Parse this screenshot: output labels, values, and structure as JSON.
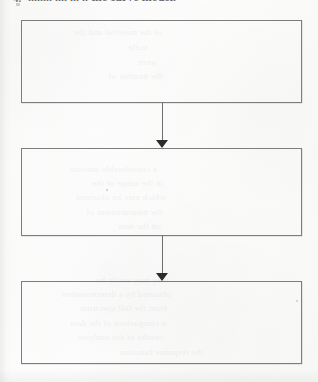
{
  "document": {
    "kind": "scanned-page-flowchart",
    "page_background_color": "#fdfdfd",
    "ink_color": "#2b2b2b",
    "box_border_color": "#7d7d7d",
    "connector_color": "#6e6e6e"
  },
  "heading": {
    "marker": "4.",
    "text": "........ .... ... .. the curve model.",
    "note": "clipped by top edge of image"
  },
  "diagram": {
    "title": "",
    "orientation": "vertical",
    "node_count": 3,
    "connector_count": 2,
    "nodes": [
      {
        "id": "box-1",
        "label": "",
        "x": 21,
        "y": 20,
        "width": 281,
        "height": 83
      },
      {
        "id": "box-2",
        "label": "",
        "x": 21,
        "y": 148,
        "width": 281,
        "height": 88
      },
      {
        "id": "box-3",
        "label": "",
        "x": 21,
        "y": 281,
        "width": 281,
        "height": 83
      }
    ],
    "connectors": [
      {
        "id": "arrow-1",
        "from": "box-1",
        "to": "box-2",
        "x": 156,
        "y": 103,
        "length": 45,
        "direction": "down",
        "arrowhead": "solid-triangle"
      },
      {
        "id": "arrow-2",
        "from": "box-2",
        "to": "box-3",
        "x": 156,
        "y": 236,
        "length": 45,
        "direction": "down",
        "arrowhead": "solid-triangle"
      }
    ]
  },
  "bleedthrough": {
    "note": "faint mirrored text showing through from the reverse side of the sheet",
    "lines": [
      {
        "text": "of the material and the",
        "x": 74,
        "y": 26,
        "size": 9
      },
      {
        "text": "scale",
        "x": 128,
        "y": 41,
        "size": 9
      },
      {
        "text": "were",
        "x": 138,
        "y": 56,
        "size": 9
      },
      {
        "text": "the number of",
        "x": 108,
        "y": 70,
        "size": 9
      },
      {
        "text": "a considerable amount",
        "x": 70,
        "y": 163,
        "size": 9
      },
      {
        "text": "in the range of the",
        "x": 92,
        "y": 177,
        "size": 9
      },
      {
        "text": "which may be obtained",
        "x": 76,
        "y": 191,
        "size": 9
      },
      {
        "text": "the measurement of",
        "x": 86,
        "y": 206,
        "size": 9
      },
      {
        "text": "on the data",
        "x": 118,
        "y": 220,
        "size": 9
      },
      {
        "text": "they may easily be",
        "x": 96,
        "y": 274,
        "size": 9
      },
      {
        "text": "obtained by a determination",
        "x": 62,
        "y": 288,
        "size": 9
      },
      {
        "text": "from the full spectrum",
        "x": 80,
        "y": 302,
        "size": 9
      },
      {
        "text": "a comparison of the data",
        "x": 70,
        "y": 317,
        "size": 9
      },
      {
        "text": "results of the analysis",
        "x": 78,
        "y": 331,
        "size": 9
      },
      {
        "text": "the response function",
        "x": 120,
        "y": 346,
        "size": 9
      }
    ]
  }
}
